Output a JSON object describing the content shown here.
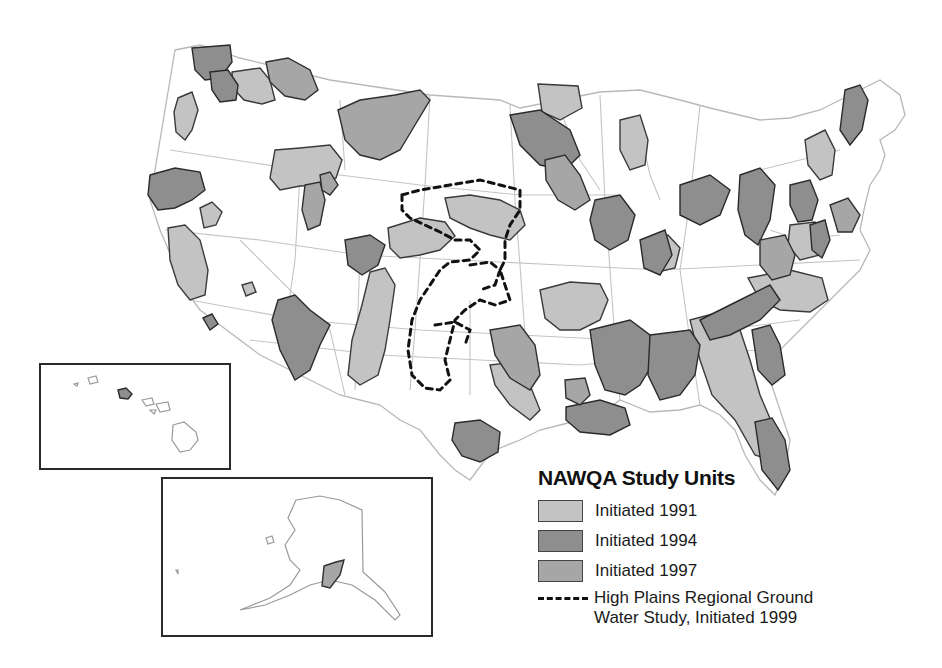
{
  "legend": {
    "title": "NAWQA Study Units",
    "items": [
      {
        "label": "Initiated 1991",
        "color": "#c3c3c3"
      },
      {
        "label": "Initiated 1994",
        "color": "#8e8e8e"
      },
      {
        "label": "Initiated 1997",
        "color": "#a6a6a6"
      }
    ],
    "dashed_line": {
      "line1": "High Plains Regional Ground",
      "line2": "Water Study, Initiated 1999",
      "color": "#111111"
    }
  },
  "insets": [
    {
      "name": "Hawaii",
      "highlighted_unit": "Oahu",
      "unit_color": "#8e8e8e"
    },
    {
      "name": "Alaska",
      "highlighted_unit": "Cook Inlet Basin",
      "unit_color": "#a6a6a6"
    }
  ],
  "colors": {
    "background": "#ffffff",
    "state_lines": "#b8b8b8",
    "unit_outline": "#2a2a2a"
  }
}
